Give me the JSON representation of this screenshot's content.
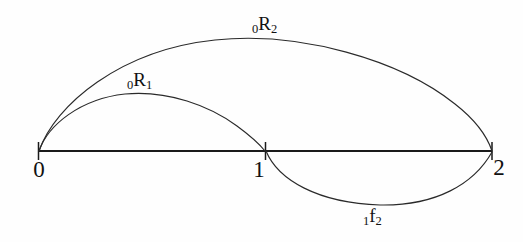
{
  "figure": {
    "type": "arc-diagram",
    "background_color": "#ffffff",
    "stroke_color": "#1a1a1a",
    "axis": {
      "name": "number-line",
      "y": 151,
      "x_start": 38,
      "x_end": 492,
      "ticks": [
        {
          "label": "0",
          "x": 38,
          "value": 0
        },
        {
          "label": "1",
          "x": 265,
          "value": 1
        },
        {
          "label": "2",
          "x": 492,
          "value": 2
        }
      ]
    },
    "arcs": [
      {
        "name": "arc-r2",
        "label_prefix": "0",
        "label_main": "R",
        "label_suffix": "2",
        "label_text": "0R2",
        "from_tick": 0,
        "to_tick": 2,
        "side": "above",
        "peak_y": 38
      },
      {
        "name": "arc-r1",
        "label_prefix": "0",
        "label_main": "R",
        "label_suffix": "1",
        "label_text": "0R1",
        "from_tick": 0,
        "to_tick": 1,
        "side": "above",
        "peak_y": 94
      },
      {
        "name": "arc-f2",
        "label_prefix": "1",
        "label_main": "f",
        "label_suffix": "2",
        "label_text": "1f2",
        "from_tick": 1,
        "to_tick": 2,
        "side": "below",
        "peak_y": 205
      }
    ]
  }
}
